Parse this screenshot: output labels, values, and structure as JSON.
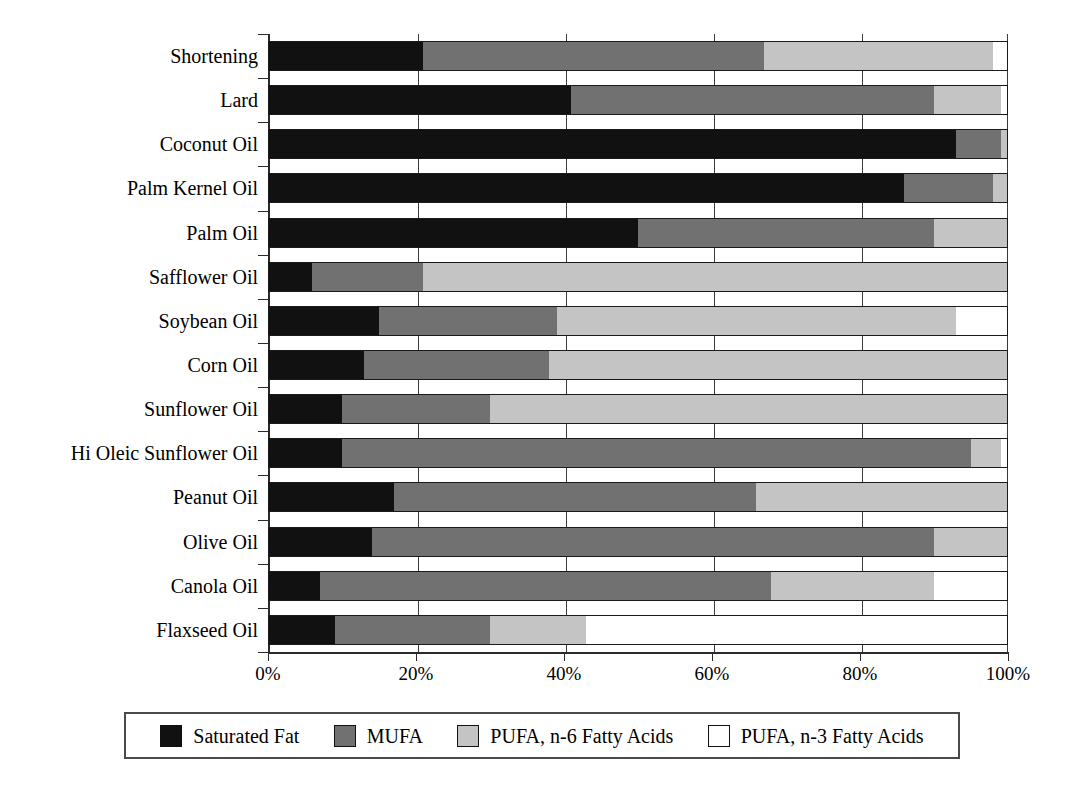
{
  "chart_data": {
    "type": "bar",
    "subtype": "horizontal-stacked-100",
    "title": "",
    "xlabel": "",
    "ylabel": "",
    "xlim": [
      0,
      100
    ],
    "xticks": [
      "0%",
      "20%",
      "40%",
      "60%",
      "80%",
      "100%"
    ],
    "xtick_values": [
      0,
      20,
      40,
      60,
      80,
      100
    ],
    "grid": true,
    "grid_axis": "x",
    "legend_position": "bottom",
    "categories": [
      "Shortening",
      "Lard",
      "Coconut Oil",
      "Palm Kernel Oil",
      "Palm Oil",
      "Safflower Oil",
      "Soybean Oil",
      "Corn Oil",
      "Sunflower Oil",
      "Hi Oleic Sunflower Oil",
      "Peanut Oil",
      "Olive Oil",
      "Canola Oil",
      "Flaxseed Oil"
    ],
    "series": [
      {
        "name": "Saturated Fat",
        "color": "#111111",
        "values": [
          21,
          41,
          93,
          86,
          50,
          6,
          15,
          13,
          10,
          10,
          17,
          14,
          7,
          9
        ]
      },
      {
        "name": "MUFA",
        "color": "#717171",
        "values": [
          46,
          49,
          6,
          12,
          40,
          15,
          24,
          25,
          20,
          85,
          49,
          76,
          61,
          21
        ]
      },
      {
        "name": "PUFA, n-6 Fatty Acids",
        "color": "#c4c4c4",
        "values": [
          31,
          9,
          1,
          2,
          10,
          79,
          54,
          62,
          70,
          4,
          34,
          10,
          22,
          13
        ]
      },
      {
        "name": "PUFA, n-3 Fatty Acids",
        "color": "#ffffff",
        "values": [
          2,
          1,
          0,
          0,
          0,
          0,
          7,
          0,
          0,
          1,
          0,
          0,
          10,
          57
        ]
      }
    ]
  },
  "legend": {
    "items": [
      {
        "label": "Saturated Fat",
        "color": "#111111"
      },
      {
        "label": "MUFA",
        "color": "#717171"
      },
      {
        "label": "PUFA, n-6 Fatty Acids",
        "color": "#c4c4c4"
      },
      {
        "label": "PUFA, n-3 Fatty Acids",
        "color": "#ffffff"
      }
    ]
  }
}
